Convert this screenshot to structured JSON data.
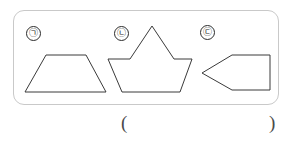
{
  "page": {
    "width": 292,
    "height": 147,
    "background": "#ffffff",
    "ink_color": "#3a3a3a",
    "box_border_color": "#c9c9c9"
  },
  "figure_box": {
    "label": "figure-group-box"
  },
  "figures": [
    {
      "marker": "㉠",
      "marker_name": "giyeok",
      "shape_name": "trapezoid",
      "points": "26,42 6,42 0,0 0,0"
    },
    {
      "marker": "㉡",
      "marker_name": "nieun",
      "shape_name": "crown-polygon",
      "points": "0,0"
    },
    {
      "marker": "㉢",
      "marker_name": "digeut",
      "shape_name": "left-arrow-pentagon",
      "points": "0,0"
    }
  ],
  "shape_geometry": {
    "trapezoid": "5,42 26,5 66,5 86,42",
    "crown": "44,37 44,37 44,5 44,5 44,5",
    "crown_points": "0,37 22,37 44,4 66,37 84,37 72,70 14,70",
    "arrow_pentagon": "6,23 36,5 74,5 74,40 36,40"
  },
  "answer": {
    "open_paren": "(",
    "close_paren": ")",
    "value": "",
    "ghost_text": ""
  },
  "scan_artifact": {
    "text": ""
  }
}
